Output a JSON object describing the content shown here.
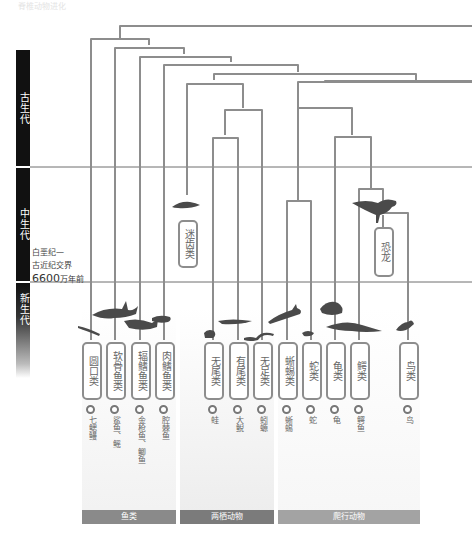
{
  "header": {
    "faint_title": "脊椎动物进化"
  },
  "eras": [
    {
      "id": "paleozoic",
      "label": "古生代"
    },
    {
      "id": "mesozoic",
      "label": "中生代"
    },
    {
      "id": "cenozoic",
      "label": "新生代"
    }
  ],
  "boundary": {
    "line1": "白垩纪—",
    "line2": "古近纪交界",
    "number": "6600",
    "unit": "万年前"
  },
  "clades": [
    {
      "id": "cyclostomes",
      "label": "圆口类",
      "example": "七鳃鳗",
      "x": 91
    },
    {
      "id": "chondrichthyes",
      "label": "软骨鱼类",
      "example": "鲨鱼、鳐",
      "x": 115
    },
    {
      "id": "actinopterygii",
      "label": "辐鳍鱼类",
      "example": "金枪鱼、鲫鱼",
      "x": 140
    },
    {
      "id": "sarcopterygii",
      "label": "肉鳍鱼类",
      "example": "腔棘鱼",
      "x": 164
    },
    {
      "id": "labyrinthodontia",
      "label": "迷齿类",
      "extinct": true,
      "x": 187
    },
    {
      "id": "anura",
      "label": "无尾类",
      "example": "蛙",
      "x": 213
    },
    {
      "id": "caudata",
      "label": "有尾类",
      "example": "大鲵",
      "x": 238
    },
    {
      "id": "gymnophiona",
      "label": "无足类",
      "example": "蚓螈",
      "x": 262
    },
    {
      "id": "lizards",
      "label": "蜥蜴类",
      "example": "蜥蜴",
      "x": 287
    },
    {
      "id": "snakes",
      "label": "蛇类",
      "example": "蛇",
      "x": 311
    },
    {
      "id": "turtles",
      "label": "龟类",
      "example": "龟",
      "x": 335
    },
    {
      "id": "crocodiles",
      "label": "鳄类",
      "example": "鳄鱼",
      "x": 359
    },
    {
      "id": "dinosaurs",
      "label": "恐龙",
      "extinct": true,
      "x": 383
    },
    {
      "id": "birds",
      "label": "鸟类",
      "example": "鸟",
      "x": 408
    }
  ],
  "groups": [
    {
      "id": "fish",
      "label": "鱼类"
    },
    {
      "id": "amphibians",
      "label": "两栖动物"
    },
    {
      "id": "reptiles",
      "label": "爬行动物"
    }
  ],
  "colors": {
    "branch": "#8d8d8d",
    "era_bar": "#111111",
    "boundary_line": "#6f6f6f",
    "group_fish": "#8a8a8a",
    "group_amphibians": "#7b7b7b",
    "group_reptiles": "#a3a3a3"
  }
}
